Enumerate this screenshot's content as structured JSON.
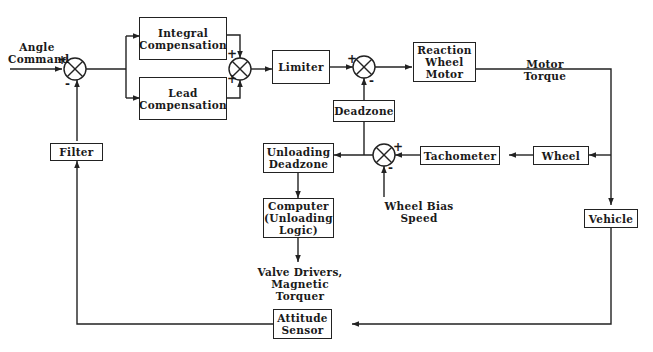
{
  "diagram": {
    "type": "block-diagram",
    "inputs": {
      "angle_command": "Angle\nCommand",
      "wheel_bias_speed": "Wheel Bias Speed"
    },
    "outputs": {
      "valve_drivers": "Valve Drivers,\nMagnetic Torquer"
    },
    "signals": {
      "motor_torque": "Motor Torque"
    },
    "blocks": {
      "integral": "Integral\nCompensation",
      "lead": "Lead\nCompensation",
      "limiter": "Limiter",
      "reaction_wheel_motor": "Reaction\nWheel\nMotor",
      "deadzone": "Deadzone",
      "unloading_deadzone": "Unloading\nDeadzone",
      "computer": "Computer\n(Unloading\nLogic)",
      "tachometer": "Tachometer",
      "wheel": "Wheel",
      "vehicle": "Vehicle",
      "filter": "Filter",
      "attitude_sensor": "Attitude\nSensor"
    },
    "summing_junctions": {
      "sj1": {
        "top": "+",
        "bottom": "-"
      },
      "sj2": {
        "top": "+",
        "bottom": "+"
      },
      "sj3": {
        "top": "+",
        "bottom": "-"
      },
      "sj4": {
        "top": "+",
        "bottom": "-"
      }
    },
    "connections": [
      [
        "Angle Command",
        "SJ1 (+)"
      ],
      [
        "SJ1",
        "Integral Compensation"
      ],
      [
        "SJ1",
        "Lead Compensation"
      ],
      [
        "Integral Compensation",
        "SJ2 (+)"
      ],
      [
        "Lead Compensation",
        "SJ2 (+)"
      ],
      [
        "SJ2",
        "Limiter"
      ],
      [
        "Limiter",
        "SJ3 (+)"
      ],
      [
        "Deadzone",
        "SJ3 (-)"
      ],
      [
        "SJ3",
        "Reaction Wheel Motor"
      ],
      [
        "Reaction Wheel Motor",
        "Motor Torque"
      ],
      [
        "Motor Torque",
        "Wheel"
      ],
      [
        "Motor Torque",
        "Vehicle"
      ],
      [
        "Wheel",
        "Tachometer"
      ],
      [
        "Tachometer",
        "SJ4 (+)"
      ],
      [
        "Wheel Bias Speed",
        "SJ4 (-)"
      ],
      [
        "SJ4",
        "Deadzone"
      ],
      [
        "SJ4",
        "Unloading Deadzone"
      ],
      [
        "Unloading Deadzone",
        "Computer (Unloading Logic)"
      ],
      [
        "Computer (Unloading Logic)",
        "Valve Drivers, Magnetic Torquer"
      ],
      [
        "Vehicle",
        "Attitude Sensor"
      ],
      [
        "Attitude Sensor",
        "Filter"
      ],
      [
        "Filter",
        "SJ1 (-)"
      ]
    ]
  },
  "colors": {
    "line": "#222222",
    "background": "#ffffff"
  }
}
